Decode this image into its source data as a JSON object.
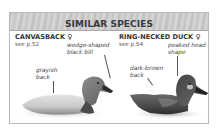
{
  "panel": {
    "title": "SIMILAR SPECIES"
  },
  "species": [
    {
      "name": "CANVASBACK",
      "sex_symbol": "♀",
      "page_ref": "see p.52",
      "annotations": [
        {
          "text_line1": "wedge-shaped",
          "text_line2": "black bill"
        },
        {
          "text_line1": "grayish",
          "text_line2": "back"
        }
      ]
    },
    {
      "name": "RING-NECKED DUCK",
      "sex_symbol": "♀",
      "page_ref": "see p.54",
      "annotations": [
        {
          "text_line1": "peaked head",
          "text_line2": "shape"
        },
        {
          "text_line1": "dark-brown",
          "text_line2": "back"
        }
      ]
    }
  ],
  "colors": {
    "header_bg": "#c8c8c8",
    "border": "#b9b9b9",
    "text": "#333333"
  }
}
